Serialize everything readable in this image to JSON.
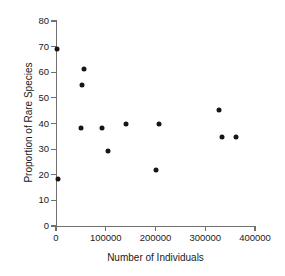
{
  "chart_data": {
    "type": "scatter",
    "title": "",
    "xlabel": "Number of Individuals",
    "ylabel": "Proportion of Rare Species",
    "xlim": [
      0,
      400000
    ],
    "ylim": [
      0,
      80
    ],
    "xticks": [
      0,
      100000,
      200000,
      300000,
      400000
    ],
    "xtick_labels": [
      "0",
      "100000",
      "200000",
      "300000",
      "400000"
    ],
    "yticks": [
      0,
      10,
      20,
      30,
      40,
      50,
      60,
      70,
      80
    ],
    "ytick_labels": [
      "0",
      "10",
      "20",
      "30",
      "40",
      "50",
      "60",
      "70",
      "80"
    ],
    "grid": false,
    "legend": null,
    "marker": "filled-circle",
    "marker_color": "#161616",
    "axis_color": "#707070",
    "series": [
      {
        "name": "sites",
        "points": [
          {
            "x": 2000,
            "y": 69.2
          },
          {
            "x": 4000,
            "y": 18.4
          },
          {
            "x": 50500,
            "y": 38.4
          },
          {
            "x": 52500,
            "y": 55.2
          },
          {
            "x": 56500,
            "y": 61.4
          },
          {
            "x": 93000,
            "y": 38.4
          },
          {
            "x": 105000,
            "y": 29.2
          },
          {
            "x": 141000,
            "y": 40.0
          },
          {
            "x": 200000,
            "y": 21.8
          },
          {
            "x": 208000,
            "y": 40.0
          },
          {
            "x": 327000,
            "y": 45.4
          },
          {
            "x": 333000,
            "y": 34.8
          },
          {
            "x": 361000,
            "y": 34.8
          }
        ]
      }
    ]
  }
}
